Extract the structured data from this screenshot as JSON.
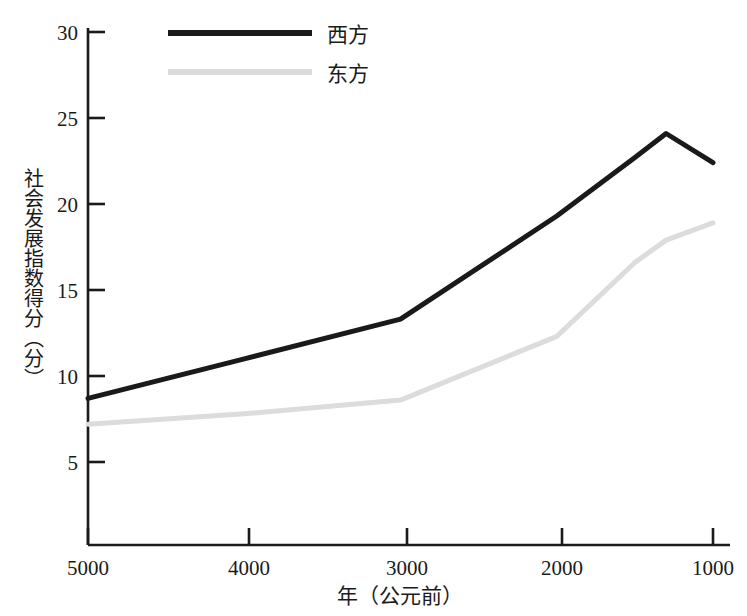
{
  "chart_data": {
    "type": "line",
    "title": "",
    "subtitle": "",
    "xlabel": "年（公元前）",
    "ylabel": "社会发展指数得分（分）",
    "x": [
      5000,
      4000,
      3000,
      2000,
      1500,
      1300,
      1000
    ],
    "xlim": [
      5000,
      950
    ],
    "ylim": [
      0,
      30
    ],
    "x_ticks": [
      5000,
      4000,
      3000,
      2000,
      1000
    ],
    "x_tick_labels": [
      "5000",
      "4000",
      "3000",
      "2000",
      "1000"
    ],
    "y_ticks": [
      5,
      10,
      15,
      20,
      25,
      30
    ],
    "y_tick_labels": [
      "5",
      "10",
      "15",
      "20",
      "25",
      "30"
    ],
    "grid": false,
    "legend_position": "top-center",
    "series": [
      {
        "name": "西方",
        "color": "#1a1a1a",
        "line_width": 5,
        "values": [
          8.7,
          11.0,
          13.3,
          19.3,
          22.7,
          24.1,
          22.4
        ]
      },
      {
        "name": "东方",
        "color": "#dcdcdc",
        "line_width": 5,
        "values": [
          7.2,
          7.8,
          8.6,
          12.3,
          16.6,
          17.9,
          18.9
        ]
      }
    ],
    "annotations": []
  },
  "axis": {
    "y_tick_labels": [
      "30",
      "25",
      "20",
      "15",
      "10",
      "5"
    ],
    "x_tick_labels": [
      "5000",
      "4000",
      "3000",
      "2000",
      "1000"
    ],
    "x_title": "年（公元前）",
    "y_title": "社会发展指数得分（分）"
  },
  "legend": {
    "entries": [
      {
        "label": "西方",
        "color": "#1a1a1a"
      },
      {
        "label": "东方",
        "color": "#dcdcdc"
      }
    ]
  },
  "colors": {
    "west_line": "#1a1a1a",
    "east_line": "#dcdcdc",
    "axis": "#1a1a1a",
    "background": "#ffffff"
  }
}
